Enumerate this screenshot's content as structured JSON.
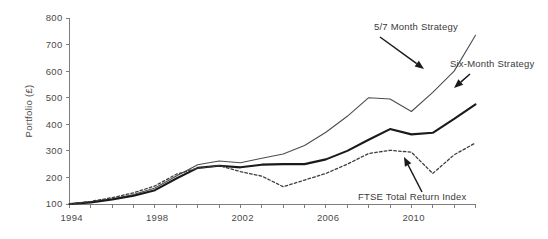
{
  "chart_data": {
    "type": "line",
    "title": "",
    "subtitle": "",
    "xlabel": "",
    "ylabel": "Portfolio (£)",
    "xlim": [
      1994,
      2013
    ],
    "ylim": [
      100,
      800
    ],
    "grid": false,
    "legend_position": "inline-annotations",
    "y_ticks": [
      100,
      200,
      300,
      400,
      500,
      600,
      700,
      800
    ],
    "y_tick_labels": [
      "100",
      "200",
      "300",
      "400",
      "500",
      "600",
      "700",
      "800"
    ],
    "x_ticks": [
      1994,
      1995,
      1996,
      1997,
      1998,
      1999,
      2000,
      2001,
      2002,
      2003,
      2004,
      2005,
      2006,
      2007,
      2008,
      2009,
      2010,
      2011,
      2012,
      2013
    ],
    "x_tick_labels_shown": [
      "1994",
      "1998",
      "2002",
      "2006",
      "2010"
    ],
    "x_tick_labels_shown_values": [
      1994,
      1998,
      2002,
      2006,
      2010
    ],
    "x": [
      1994,
      1995,
      1996,
      1997,
      1998,
      1999,
      2000,
      2001,
      2002,
      2003,
      2004,
      2005,
      2006,
      2007,
      2008,
      2009,
      2010,
      2011,
      2012,
      2013
    ],
    "series": [
      {
        "name": "5/7 Month Strategy",
        "style": "thin-solid",
        "color": "#4d4d4d",
        "values": [
          100,
          108,
          120,
          136,
          160,
          205,
          248,
          262,
          255,
          272,
          288,
          320,
          370,
          430,
          500,
          495,
          448,
          520,
          600,
          735
        ]
      },
      {
        "name": "Six-Month Strategy",
        "style": "thick-solid",
        "color": "#1a1a1a",
        "values": [
          100,
          106,
          117,
          131,
          152,
          196,
          236,
          244,
          238,
          248,
          250,
          250,
          268,
          300,
          342,
          382,
          362,
          368,
          420,
          475
        ]
      },
      {
        "name": "FTSE Total Return Index",
        "style": "dotted",
        "color": "#3d3d3d",
        "values": [
          100,
          110,
          124,
          142,
          168,
          212,
          235,
          244,
          222,
          205,
          165,
          190,
          215,
          250,
          290,
          302,
          295,
          215,
          285,
          330
        ]
      }
    ],
    "series_endpoints": {
      "5/7 Month Strategy": 735,
      "Six-Month Strategy": 545,
      "FTSE Total Return Index": 385
    },
    "annotations": [
      {
        "name": "annotation-5-7-month-strategy",
        "label": "5/7 Month Strategy",
        "text_x": 374,
        "text_y": 30,
        "anchor": "start",
        "arrow_from_x": 380,
        "arrow_from_y": 37,
        "arrow_to_x": 424,
        "arrow_to_y": 69
      },
      {
        "name": "annotation-six-month-strategy",
        "label": "Six-Month Strategy",
        "text_x": 450,
        "text_y": 67,
        "anchor": "start",
        "arrow_from_x": 470,
        "arrow_from_y": 74,
        "arrow_to_x": 454,
        "arrow_to_y": 88
      },
      {
        "name": "annotation-ftse-total-return-index",
        "label": "FTSE Total Return Index",
        "text_x": 358,
        "text_y": 200,
        "anchor": "start",
        "arrow_from_x": 422,
        "arrow_from_y": 192,
        "arrow_to_x": 404,
        "arrow_to_y": 157
      }
    ]
  },
  "figure": {
    "background_color": "#ffffff",
    "axis_color": "#7d7d7d",
    "text_color": "#3a3a3a"
  }
}
